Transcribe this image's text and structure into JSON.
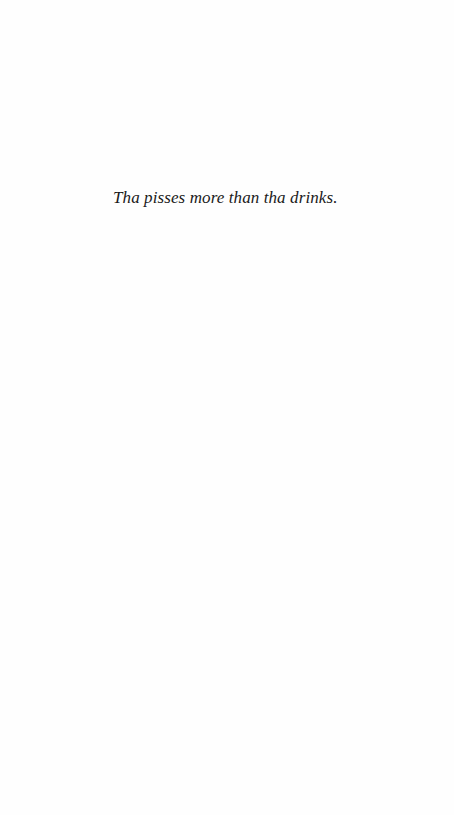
{
  "page": {
    "background_color": "#fefefe",
    "text_color": "#1a1a1a",
    "quote": "Tha pisses more than tha drinks."
  }
}
